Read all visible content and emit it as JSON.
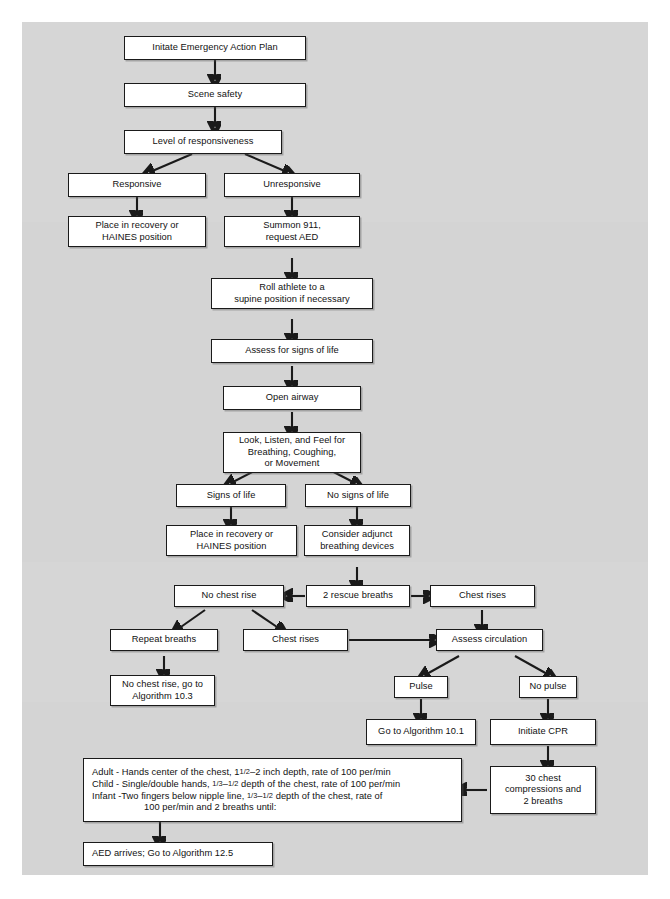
{
  "figure": {
    "type": "flowchart",
    "background_color": "#d4d4d4",
    "node_fill": "#ffffff",
    "node_border": "#1a1a1a"
  },
  "nodes": {
    "initiate_eap": "Initate Emergency Action Plan",
    "scene_safety": "Scene safety",
    "level_of_responsiveness": "Level of responsiveness",
    "responsive": "Responsive",
    "unresponsive": "Unresponsive",
    "place_recovery_haines_1": "Place in recovery or\nHAINES position",
    "summon_911": "Summon 911,\nrequest AED",
    "roll_athlete": "Roll athlete to a\nsupine position if necessary",
    "assess_signs_of_life": "Assess for signs of life",
    "open_airway": "Open airway",
    "look_listen_feel": "Look, Listen, and Feel for\nBreathing, Coughing,\nor Movement",
    "signs_of_life": "Signs of life",
    "no_signs_of_life": "No signs of life",
    "place_recovery_haines_2": "Place in recovery or\nHAINES position",
    "consider_adjunct": "Consider adjunct\nbreathing devices",
    "no_chest_rise": "No chest rise",
    "two_rescue_breaths": "2 rescue breaths",
    "chest_rises_right": "Chest rises",
    "repeat_breaths": "Repeat breaths",
    "chest_rises_mid": "Chest rises",
    "assess_circulation": "Assess circulation",
    "no_chest_rise_go_to": "No chest rise, go to\nAlgorithm 10.3",
    "pulse": "Pulse",
    "no_pulse": "No pulse",
    "go_to_algorithm_101": "Go to Algorithm 10.1",
    "initiate_cpr": "Initiate CPR",
    "thirty_compressions": "30 chest\ncompressions and\n2 breaths",
    "cpr_details_line1": "Adult - Hands center of the chest, 1",
    "cpr_details_line1_frac": "1/2",
    "cpr_details_line1b": "–2 inch depth, rate of 100 per/min",
    "cpr_details_line2a": "Child - Single/double hands, ",
    "cpr_details_line2_frac1": "1/3",
    "cpr_details_line2_dash": "–",
    "cpr_details_line2_frac2": "1/2",
    "cpr_details_line2b": " depth of the chest, rate of 100 per/min",
    "cpr_details_line3a": "Infant -Two fingers below nipple line, ",
    "cpr_details_line3_frac1": "1/3",
    "cpr_details_line3_dash": "–",
    "cpr_details_line3_frac2": "1/2",
    "cpr_details_line3b": " depth of the chest, rate of",
    "cpr_details_line4": "100 per/min and 2 breaths until:",
    "aed_arrives": "AED arrives; Go to Algorithm 12.5"
  },
  "edges": [
    {
      "from": "initiate_eap",
      "to": "scene_safety",
      "style": "arrow-down"
    },
    {
      "from": "scene_safety",
      "to": "level_of_responsiveness",
      "style": "arrow-down"
    },
    {
      "from": "level_of_responsiveness",
      "to": "responsive",
      "style": "arrow-diagonal-left"
    },
    {
      "from": "level_of_responsiveness",
      "to": "unresponsive",
      "style": "arrow-diagonal-right"
    },
    {
      "from": "responsive",
      "to": "place_recovery_haines_1",
      "style": "arrow-down"
    },
    {
      "from": "unresponsive",
      "to": "summon_911",
      "style": "arrow-down"
    },
    {
      "from": "summon_911",
      "to": "roll_athlete",
      "style": "arrow-down"
    },
    {
      "from": "roll_athlete",
      "to": "assess_signs_of_life",
      "style": "arrow-down"
    },
    {
      "from": "assess_signs_of_life",
      "to": "open_airway",
      "style": "arrow-down"
    },
    {
      "from": "open_airway",
      "to": "look_listen_feel",
      "style": "arrow-down"
    },
    {
      "from": "look_listen_feel",
      "to": "signs_of_life",
      "style": "arrow-diagonal-left"
    },
    {
      "from": "look_listen_feel",
      "to": "no_signs_of_life",
      "style": "arrow-diagonal-right"
    },
    {
      "from": "signs_of_life",
      "to": "place_recovery_haines_2",
      "style": "arrow-down"
    },
    {
      "from": "no_signs_of_life",
      "to": "consider_adjunct",
      "style": "arrow-down"
    },
    {
      "from": "consider_adjunct",
      "to": "two_rescue_breaths",
      "style": "arrow-down"
    },
    {
      "from": "two_rescue_breaths",
      "to": "no_chest_rise",
      "style": "arrow-left"
    },
    {
      "from": "two_rescue_breaths",
      "to": "chest_rises_right",
      "style": "arrow-right"
    },
    {
      "from": "no_chest_rise",
      "to": "repeat_breaths",
      "style": "arrow-diagonal-left"
    },
    {
      "from": "no_chest_rise",
      "to": "chest_rises_mid",
      "style": "arrow-diagonal-right"
    },
    {
      "from": "chest_rises_right",
      "to": "assess_circulation",
      "style": "arrow-down"
    },
    {
      "from": "chest_rises_mid",
      "to": "assess_circulation",
      "style": "arrow-right"
    },
    {
      "from": "repeat_breaths",
      "to": "no_chest_rise_go_to",
      "style": "arrow-down"
    },
    {
      "from": "assess_circulation",
      "to": "pulse",
      "style": "arrow-diagonal-left"
    },
    {
      "from": "assess_circulation",
      "to": "no_pulse",
      "style": "arrow-diagonal-right"
    },
    {
      "from": "pulse",
      "to": "go_to_algorithm_101",
      "style": "arrow-down"
    },
    {
      "from": "no_pulse",
      "to": "initiate_cpr",
      "style": "arrow-down"
    },
    {
      "from": "initiate_cpr",
      "to": "thirty_compressions",
      "style": "arrow-down"
    },
    {
      "from": "thirty_compressions",
      "to": "cpr_details",
      "style": "arrow-left"
    },
    {
      "from": "cpr_details",
      "to": "aed_arrives",
      "style": "arrow-down"
    }
  ]
}
